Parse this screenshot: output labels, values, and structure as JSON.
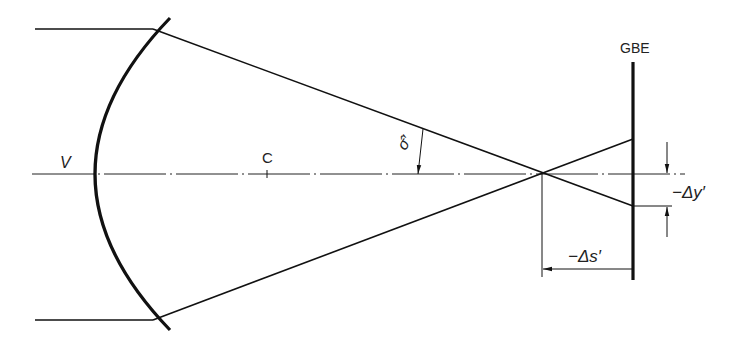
{
  "diagram": {
    "type": "optics-concave-mirror-defocus",
    "labels": {
      "vertex": "V",
      "center": "C",
      "angle": "σ̂′",
      "image_plane": "GBE",
      "delta_y": "−Δy′",
      "delta_s": "−Δs′"
    },
    "colors": {
      "line": "#111111",
      "background": "#ffffff"
    }
  }
}
